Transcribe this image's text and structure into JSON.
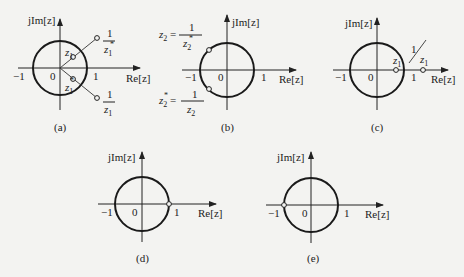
{
  "figure": {
    "axis_labels": {
      "imag": "jIm[z]",
      "real": "Re[z]",
      "neg_one": "−1",
      "zero": "0",
      "one": "1"
    },
    "panels": [
      {
        "id": "a",
        "caption": "(a)",
        "points": [
          {
            "label": "z1",
            "desc": "inside circle, upper"
          },
          {
            "label": "z1*",
            "desc": "inside circle, lower"
          },
          {
            "label": "1/z1*",
            "desc": "outside circle, upper"
          },
          {
            "label": "1/z1",
            "desc": "outside circle, lower"
          }
        ]
      },
      {
        "id": "b",
        "caption": "(b)",
        "points": [
          {
            "label": "z2 = 1/z2*",
            "desc": "on circle, upper left"
          },
          {
            "label": "z2* = 1/z2",
            "desc": "on circle, lower left"
          }
        ]
      },
      {
        "id": "c",
        "caption": "(c)",
        "points": [
          {
            "label": "z1",
            "desc": "inside circle on real axis"
          },
          {
            "label": "1/z1",
            "desc": "outside circle on real axis"
          }
        ]
      },
      {
        "id": "d",
        "caption": "(d)",
        "points": [
          {
            "label": "",
            "desc": "at z = 1"
          }
        ]
      },
      {
        "id": "e",
        "caption": "(e)",
        "points": [
          {
            "label": "",
            "desc": "at z = −1"
          }
        ]
      }
    ]
  },
  "labels": {
    "a": {
      "z1": "z",
      "z1_sub": "1",
      "inv_conj_num": "1",
      "inv_conj_den": "z",
      "inv_conj_sub": "1",
      "conj": "z",
      "conj_sub": "1",
      "inv_num": "1",
      "inv_den": "z",
      "inv_sub": "1",
      "caption": "(a)"
    },
    "b": {
      "top_lhs": "z",
      "top_sub": "2",
      "eq": "=",
      "top_num": "1",
      "top_den": "z",
      "top_den_sub": "2",
      "bot_lhs": "z",
      "bot_sub": "2",
      "bot_num": "1",
      "bot_den": "z",
      "bot_den_sub": "2",
      "caption": "(b)"
    },
    "c": {
      "z1": "z",
      "z1_sub": "1",
      "inv_num": "1",
      "inv_den": "z",
      "inv_sub": "1",
      "caption": "(c)"
    },
    "d": {
      "caption": "(d)"
    },
    "e": {
      "caption": "(e)"
    },
    "star": "*",
    "imag": "jIm[z]",
    "real": "Re[z]",
    "neg_one": "−1",
    "zero": "0",
    "one": "1"
  }
}
